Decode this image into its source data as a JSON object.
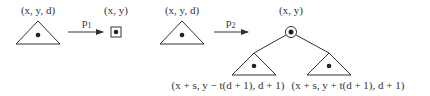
{
  "diagram": {
    "left_panel": {
      "input_label": "(x, y, d)",
      "arrow_label_main": "p",
      "arrow_label_sub": "1",
      "output_label": "(x, y)",
      "input_shape": "triangle-subtree",
      "output_shape": "boxed-leaf-node"
    },
    "right_panel": {
      "input_label": "(x, y, d)",
      "arrow_label_main": "p",
      "arrow_label_sub": "2",
      "root_label": "(x, y)",
      "input_shape": "triangle-subtree",
      "root_shape": "circled-node",
      "children": [
        {
          "label": "(x + s, y − t(d + 1), d + 1)",
          "shape": "triangle-subtree"
        },
        {
          "label": "(x + s, y + t(d + 1), d + 1)",
          "shape": "triangle-subtree"
        }
      ]
    },
    "colors": {
      "stroke": "#333333",
      "background": "#ffffff"
    }
  }
}
